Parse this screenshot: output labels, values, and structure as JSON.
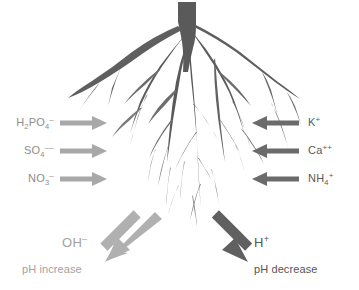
{
  "diagram": {
    "background_color": "#ffffff",
    "root": {
      "name": "plant-root-system",
      "color_dark": "#555555",
      "color_mid": "#6e6e6e",
      "color_light": "#8a8a8a"
    },
    "anions": {
      "group_label": "anion uptake",
      "arrow_color": "#a8a8a8",
      "arrow_direction": "right",
      "items": [
        {
          "formula_main": "H",
          "sub1": "2",
          "mid": "PO",
          "sub2": "4",
          "charge": "–",
          "plain": "H2PO4-"
        },
        {
          "formula_main": "SO",
          "sub1": "",
          "mid": "",
          "sub2": "4",
          "charge": "––",
          "plain": "SO4--"
        },
        {
          "formula_main": "NO",
          "sub1": "",
          "mid": "",
          "sub2": "3",
          "charge": "–",
          "plain": "NO3-"
        }
      ]
    },
    "cations": {
      "group_label": "cation uptake",
      "arrow_color": "#6b6b6b",
      "arrow_direction": "left",
      "items": [
        {
          "formula_main": "K",
          "sub2": "",
          "charge": "+",
          "plain": "K+"
        },
        {
          "formula_main": "Ca",
          "sub2": "",
          "charge": "++",
          "plain": "Ca++"
        },
        {
          "formula_main": "NH",
          "sub2": "4",
          "charge": "+",
          "plain": "NH4+"
        }
      ]
    },
    "ph_effects": [
      {
        "side": "left",
        "ion_main": "OH",
        "ion_charge": "–",
        "ion_plain": "OH-",
        "text": "pH increase",
        "arrow_color": "#b0b0b0",
        "text_color": "#a2a2a2"
      },
      {
        "side": "right",
        "ion_main": "H",
        "ion_charge": "+",
        "ion_plain": "H+",
        "text": "pH decrease",
        "arrow_color": "#606060",
        "text_color": "#555555"
      }
    ]
  }
}
